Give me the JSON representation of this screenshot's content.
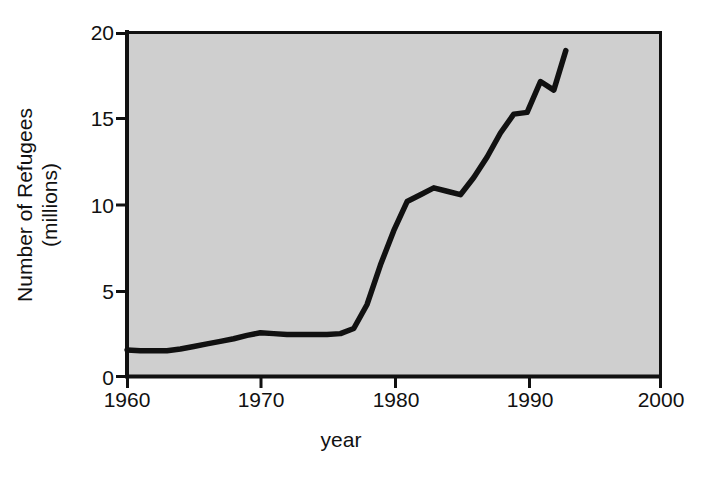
{
  "chart_data": {
    "type": "line",
    "title": "",
    "xlabel": "year",
    "ylabel": "Number of Refugees (millions)",
    "ylabel_line1": "Number of Refugees",
    "ylabel_line2": "(millions)",
    "xlim": [
      1960,
      2000
    ],
    "ylim": [
      0,
      20
    ],
    "xticks": [
      1960,
      1970,
      1980,
      1990,
      2000
    ],
    "xtick_labels": [
      "1960",
      "1970",
      "1980",
      "1990",
      "2000"
    ],
    "yticks": [
      0,
      5,
      10,
      15,
      20
    ],
    "ytick_labels": [
      "0",
      "5",
      "10",
      "15",
      "20"
    ],
    "grid": false,
    "legend": "none",
    "plot_background_color": "#cfcfcf",
    "line_color": "#111111",
    "axis_color": "#111111",
    "series": [
      {
        "name": "Number of Refugees (millions)",
        "x": [
          1960,
          1961,
          1962,
          1963,
          1964,
          1965,
          1966,
          1967,
          1968,
          1969,
          1970,
          1971,
          1972,
          1973,
          1974,
          1975,
          1976,
          1977,
          1978,
          1979,
          1980,
          1981,
          1982,
          1983,
          1984,
          1985,
          1986,
          1987,
          1988,
          1989,
          1990,
          1991,
          1992,
          1992.9
        ],
        "y": [
          1.55,
          1.5,
          1.5,
          1.5,
          1.6,
          1.75,
          1.9,
          2.05,
          2.2,
          2.4,
          2.55,
          2.5,
          2.45,
          2.45,
          2.45,
          2.45,
          2.5,
          2.8,
          4.2,
          6.5,
          8.5,
          10.2,
          10.6,
          11.0,
          10.8,
          10.6,
          11.6,
          12.8,
          14.2,
          15.3,
          15.4,
          17.2,
          16.7,
          19.0
        ]
      }
    ],
    "annotations": []
  },
  "figure": {
    "width": 706,
    "height": 481,
    "background_color": "#ffffff"
  }
}
